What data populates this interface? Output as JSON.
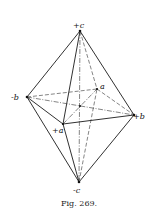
{
  "figure": {
    "caption": "Fig. 269.",
    "colors": {
      "line": "#1a1a1a",
      "background": "#ffffff"
    },
    "labels": {
      "plus_c": "+c",
      "minus_c": "-c",
      "minus_b": "-b",
      "plus_b": "+b",
      "plus_a": "+a",
      "minus_a": "a"
    },
    "vertices": {
      "plus_c": [
        80,
        31
      ],
      "minus_c": [
        79,
        182
      ],
      "minus_b": [
        27,
        97
      ],
      "plus_b": [
        134,
        115
      ],
      "plus_a": [
        63,
        124
      ],
      "minus_a": [
        97,
        89
      ],
      "center": [
        80,
        106
      ]
    }
  }
}
